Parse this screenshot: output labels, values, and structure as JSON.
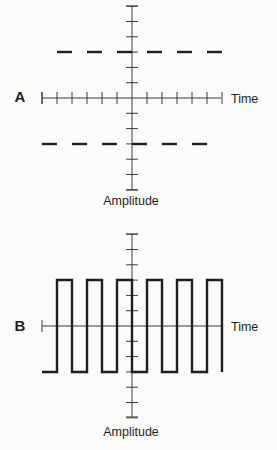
{
  "colors": {
    "background": "#fbfbfa",
    "ink": "#1e1e1e",
    "axis": "#3a3a3a"
  },
  "panels": [
    {
      "id": "A",
      "label": "A",
      "x_axis_label": "Time",
      "y_axis_label": "Amplitude",
      "description": "Two constant DC levels shown as dashed lines: positive level above axis, negative level below",
      "origin": {
        "x": 132,
        "y": 98
      },
      "x_axis": {
        "from": 42,
        "to": 221,
        "tick_spacing": 15,
        "ticks_each_side": 6,
        "show_ticks": true
      },
      "y_axis": {
        "from": 6,
        "to": 190,
        "tick_spacing": 15.3,
        "ticks_each_side": 6
      },
      "signal": {
        "type": "dashed-levels",
        "levels": [
          {
            "y": 52,
            "start": 57,
            "dash": 15,
            "period": 30,
            "count": 6
          },
          {
            "y": 144,
            "start": 42,
            "dash": 15,
            "period": 30,
            "count": 6
          }
        ]
      },
      "label_pos": {
        "x": 20,
        "y": 102
      },
      "time_label_pos": {
        "x": 231,
        "y": 103
      },
      "amp_label_pos": {
        "x": 131,
        "y": 205
      }
    },
    {
      "id": "B",
      "label": "B",
      "x_axis_label": "Time",
      "y_axis_label": "Amplitude",
      "description": "Square wave alternating between positive and negative levels",
      "origin": {
        "x": 132,
        "y": 326
      },
      "x_axis": {
        "from": 42,
        "to": 221,
        "tick_spacing": 15,
        "ticks_each_side": 0,
        "show_ticks": false
      },
      "y_axis": {
        "from": 234,
        "to": 417,
        "tick_spacing": 15.3,
        "ticks_each_side": 6
      },
      "signal": {
        "type": "square-wave",
        "high_y": 280,
        "low_y": 372,
        "start_x": 42,
        "edges": [
          57,
          72,
          87,
          102,
          117,
          132,
          147,
          162,
          177,
          192,
          207,
          222
        ]
      },
      "label_pos": {
        "x": 20,
        "y": 331
      },
      "time_label_pos": {
        "x": 231,
        "y": 331
      },
      "amp_label_pos": {
        "x": 131,
        "y": 436
      }
    }
  ]
}
